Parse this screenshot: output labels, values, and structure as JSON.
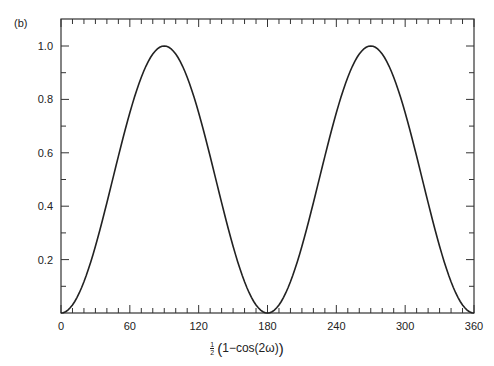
{
  "panel_label": "(b)",
  "chart_data": {
    "type": "line",
    "title": "",
    "panel": "(b)",
    "xlabel": "½(1−cos(2ω))",
    "xlabel_parts": {
      "frac_num": "1",
      "frac_den": "2",
      "open": "(",
      "body": "1−cos(2ω)",
      "close": ")"
    },
    "ylabel": "",
    "xlim": [
      0,
      360
    ],
    "ylim": [
      0,
      1.1
    ],
    "x_ticks": [
      0,
      60,
      120,
      180,
      240,
      300,
      360
    ],
    "x_tick_labels": [
      "0",
      "60",
      "120",
      "180",
      "240",
      "300",
      "360"
    ],
    "x_minor_step": 10,
    "y_ticks": [
      0.2,
      0.4,
      0.6,
      0.8,
      1.0
    ],
    "y_tick_labels": [
      "0.2",
      "0.4",
      "0.6",
      "0.8",
      "1.0"
    ],
    "y_minor_step": 0.1,
    "grid": false,
    "legend": null,
    "series": [
      {
        "name": "0.5*(1-cos(2w))",
        "formula": "sin^2(x)",
        "x": [
          0,
          10,
          20,
          30,
          40,
          50,
          60,
          70,
          80,
          90,
          100,
          110,
          120,
          130,
          140,
          150,
          160,
          170,
          180,
          190,
          200,
          210,
          220,
          230,
          240,
          250,
          260,
          270,
          280,
          290,
          300,
          310,
          320,
          330,
          340,
          350,
          360
        ],
        "values": [
          0.0,
          0.03,
          0.117,
          0.25,
          0.413,
          0.587,
          0.75,
          0.883,
          0.97,
          1.0,
          0.97,
          0.883,
          0.75,
          0.587,
          0.413,
          0.25,
          0.117,
          0.03,
          0.0,
          0.03,
          0.117,
          0.25,
          0.413,
          0.587,
          0.75,
          0.883,
          0.97,
          1.0,
          0.97,
          0.883,
          0.75,
          0.587,
          0.413,
          0.25,
          0.117,
          0.03,
          0.0
        ],
        "color": "#222222"
      }
    ]
  }
}
